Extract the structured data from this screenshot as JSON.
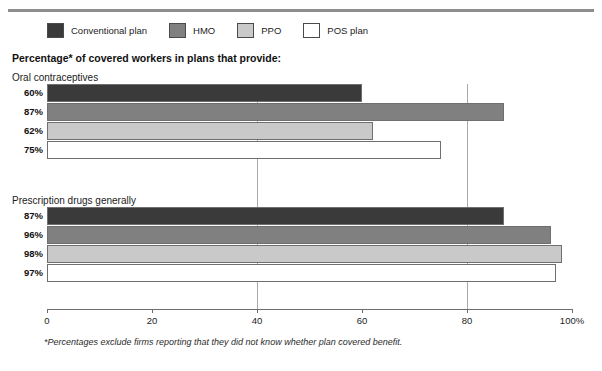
{
  "clipped_header_text": "",
  "legend": {
    "items": [
      {
        "label": "Conventional plan",
        "color": "#3a3a3a"
      },
      {
        "label": "HMO",
        "color": "#808080"
      },
      {
        "label": "PPO",
        "color": "#c9c9c9"
      },
      {
        "label": "POS plan",
        "color": "#ffffff"
      }
    ]
  },
  "subtitle": "Percentage* of covered workers in plans that provide:",
  "footnote": "*Percentages exclude firms reporting that they did not know whether plan covered benefit.",
  "chart_data": {
    "type": "bar",
    "orientation": "horizontal",
    "title": "Percentage* of covered workers in plans that provide:",
    "xlabel": "",
    "ylabel": "",
    "xlim": [
      0,
      100
    ],
    "xticks": [
      0,
      20,
      40,
      60,
      80,
      100
    ],
    "xticklabels": [
      "0",
      "20",
      "40",
      "60",
      "80",
      "100%"
    ],
    "grid": true,
    "gridlines": [
      40,
      80
    ],
    "legend_position": "top",
    "series": [
      {
        "name": "Conventional plan",
        "color": "#3a3a3a"
      },
      {
        "name": "HMO",
        "color": "#808080"
      },
      {
        "name": "PPO",
        "color": "#c9c9c9"
      },
      {
        "name": "POS plan",
        "color": "#ffffff"
      }
    ],
    "groups": [
      {
        "label": "Oral contraceptives",
        "bars": [
          {
            "series": "Conventional plan",
            "value": 60,
            "value_label": "60%",
            "color": "#3a3a3a"
          },
          {
            "series": "HMO",
            "value": 87,
            "value_label": "87%",
            "color": "#808080"
          },
          {
            "series": "PPO",
            "value": 62,
            "value_label": "62%",
            "color": "#c9c9c9"
          },
          {
            "series": "POS plan",
            "value": 75,
            "value_label": "75%",
            "color": "#ffffff"
          }
        ]
      },
      {
        "label": "Prescription drugs generally",
        "bars": [
          {
            "series": "Conventional plan",
            "value": 87,
            "value_label": "87%",
            "color": "#3a3a3a"
          },
          {
            "series": "HMO",
            "value": 96,
            "value_label": "96%",
            "color": "#808080"
          },
          {
            "series": "PPO",
            "value": 98,
            "value_label": "98%",
            "color": "#c9c9c9"
          },
          {
            "series": "POS plan",
            "value": 97,
            "value_label": "97%",
            "color": "#ffffff"
          }
        ]
      }
    ]
  },
  "layout": {
    "plot_left": 47,
    "plot_right": 572,
    "group_tops": [
      84,
      207
    ],
    "group_title_tops": [
      72,
      195
    ],
    "bar_height": 18,
    "bar_gap": 1,
    "gridline_top": 84,
    "gridline_bottom": 309
  }
}
